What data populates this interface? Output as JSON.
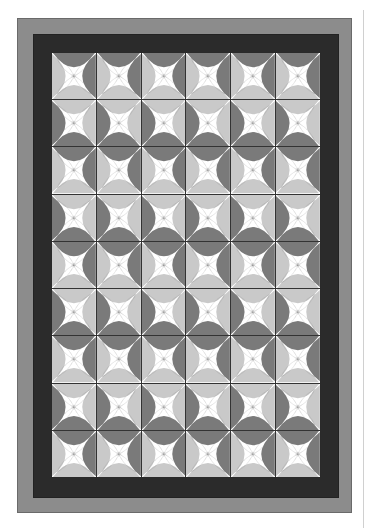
{
  "quilt": {
    "title": "",
    "rows": 9,
    "cols": 6,
    "colors": {
      "outer_border": "#8c8c8c",
      "inner_border": "#2b2b2b",
      "grid_line": "#333333",
      "star": "#ffffff",
      "melon_dark": "#7a7a7a",
      "melon_light": "#c9c9c9",
      "stitch": "#777777"
    },
    "row_patterns": {
      "even": {
        "top": "dark",
        "right": "dark",
        "bottom": "light",
        "left": "light"
      },
      "odd": {
        "top": "light",
        "right": "light",
        "bottom": "dark",
        "left": "dark"
      }
    }
  }
}
